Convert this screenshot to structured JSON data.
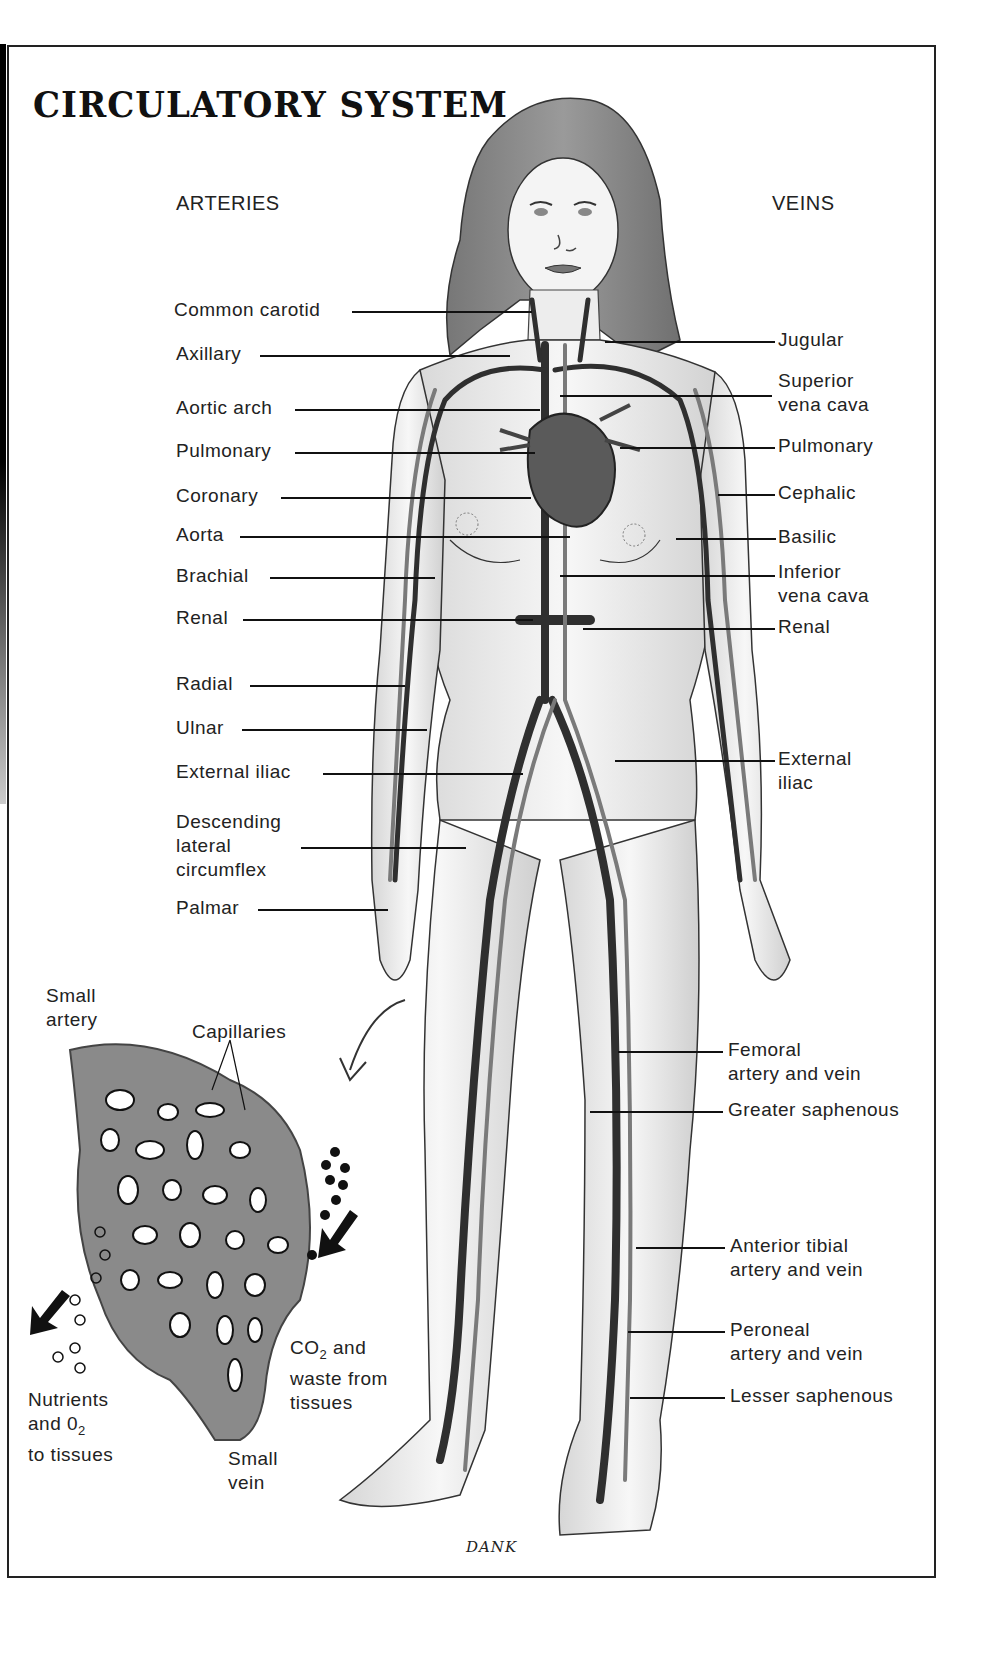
{
  "title": "CIRCULATORY SYSTEM",
  "headings": {
    "arteries": "ARTERIES",
    "veins": "VEINS"
  },
  "arteries": [
    {
      "label": "Common carotid",
      "y": 310
    },
    {
      "label": "Axillary",
      "y": 353
    },
    {
      "label": "Aortic arch",
      "y": 407
    },
    {
      "label": "Pulmonary",
      "y": 450
    },
    {
      "label": "Coronary",
      "y": 495
    },
    {
      "label": "Aorta",
      "y": 534
    },
    {
      "label": "Brachial",
      "y": 575
    },
    {
      "label": "Renal",
      "y": 617
    },
    {
      "label": "Radial",
      "y": 683
    },
    {
      "label": "Ulnar",
      "y": 727
    },
    {
      "label": "External iliac",
      "y": 771
    },
    {
      "label": "Descending\nlateral\ncircumflex",
      "y": 820
    },
    {
      "label": "Palmar",
      "y": 907
    }
  ],
  "veins": [
    {
      "label": "Jugular",
      "y": 338
    },
    {
      "label": "Superior\nvena cava",
      "y": 380
    },
    {
      "label": "Pulmonary",
      "y": 445
    },
    {
      "label": "Cephalic",
      "y": 492
    },
    {
      "label": "Basilic",
      "y": 536
    },
    {
      "label": "Inferior\nvena cava",
      "y": 571
    },
    {
      "label": "Renal",
      "y": 626
    },
    {
      "label": "External\niliac",
      "y": 756
    },
    {
      "label": "Femoral\nartery and vein",
      "y": 1044
    },
    {
      "label": "Greater saphenous",
      "y": 1106
    },
    {
      "label": "Anterior tibial\nartery and vein",
      "y": 1244
    },
    {
      "label": "Peroneal\nartery and vein",
      "y": 1326
    },
    {
      "label": "Lesser saphenous",
      "y": 1392
    }
  ],
  "inset": {
    "small_artery": "Small\nartery",
    "capillaries": "Capillaries",
    "nutrients": "Nutrients\nand 0",
    "nutrients_sub": "2",
    "nutrients_tail": "to tissues",
    "co2_pre": "CO",
    "co2_sub": "2",
    "co2_post": " and",
    "co2_rest": "waste from\ntissues",
    "small_vein": "Small\nvein"
  },
  "signature": "DANK",
  "colors": {
    "ink": "#111111",
    "vessel": "#3a3a3a",
    "skin": "#f2f2f2",
    "hair": "#8a8a8a",
    "capillary": "#7a7a7a"
  }
}
